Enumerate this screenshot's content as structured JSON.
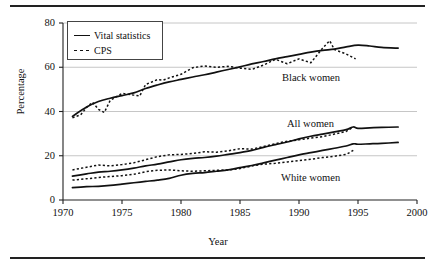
{
  "chart_data": {
    "type": "line",
    "title": "",
    "xlabel": "Year",
    "ylabel": "Percentage",
    "xlim": [
      1970,
      2000
    ],
    "ylim": [
      0,
      80
    ],
    "xticks": [
      1970,
      1975,
      1980,
      1985,
      1990,
      1995,
      2000
    ],
    "yticks": [
      0,
      20,
      40,
      60,
      80
    ],
    "grid": "horizontal",
    "legend_position": "top-left",
    "legend": [
      {
        "label": "Vital statistics",
        "style": "solid"
      },
      {
        "label": "CPS",
        "style": "dashed"
      }
    ],
    "annotations": [
      {
        "text": "Black women"
      },
      {
        "text": "All women"
      },
      {
        "text": "White women"
      }
    ],
    "series": [
      {
        "name": "Black women - Vital statistics",
        "group": "Black women",
        "source": "Vital statistics",
        "style": "solid",
        "x": [
          1970.8,
          1972,
          1973,
          1974,
          1975,
          1976,
          1977,
          1978,
          1979,
          1980,
          1981,
          1982,
          1983,
          1984,
          1985,
          1986,
          1987,
          1988,
          1989,
          1990,
          1991,
          1992,
          1993,
          1994,
          1995,
          1996,
          1997,
          1998.4
        ],
        "y": [
          37.8,
          42.0,
          44.5,
          46.0,
          47.2,
          48.4,
          50.4,
          52.0,
          53.4,
          54.5,
          55.6,
          56.6,
          57.8,
          59.0,
          60.2,
          61.5,
          62.6,
          63.8,
          64.8,
          65.8,
          66.8,
          67.6,
          68.2,
          69.2,
          70.0,
          69.6,
          69.0,
          68.6
        ]
      },
      {
        "name": "Black women - CPS",
        "group": "Black women",
        "source": "CPS",
        "style": "dashed",
        "x": [
          1970.8,
          1971.5,
          1972,
          1972.5,
          1973,
          1973.5,
          1974,
          1975,
          1976,
          1976.5,
          1977,
          1978,
          1978.5,
          1979,
          1980,
          1981,
          1982,
          1983,
          1984,
          1985,
          1986,
          1987,
          1988,
          1989,
          1990,
          1991,
          1992,
          1992.6,
          1993,
          1994,
          1994.8
        ],
        "y": [
          37.2,
          38.5,
          41.8,
          44.2,
          41.0,
          39.6,
          45.0,
          48.2,
          47.4,
          47.0,
          52.2,
          54.4,
          54.2,
          55.2,
          56.8,
          59.8,
          60.6,
          60.0,
          60.4,
          59.6,
          59.0,
          61.0,
          63.6,
          61.6,
          63.8,
          62.0,
          68.6,
          72.0,
          68.0,
          66.0,
          63.8
        ]
      },
      {
        "name": "All women - Vital statistics",
        "group": "All women",
        "source": "Vital statistics",
        "style": "solid",
        "x": [
          1970.8,
          1972,
          1973,
          1974,
          1975,
          1976,
          1977,
          1978,
          1979,
          1980,
          1981,
          1982,
          1983,
          1984,
          1985,
          1986,
          1987,
          1988,
          1989,
          1990,
          1991,
          1992,
          1993,
          1994,
          1994.6,
          1995,
          1996,
          1997,
          1998.4
        ],
        "y": [
          10.8,
          11.8,
          12.6,
          13.0,
          13.6,
          14.4,
          15.4,
          16.2,
          17.2,
          18.2,
          18.8,
          19.2,
          19.8,
          20.6,
          21.4,
          22.4,
          23.8,
          25.0,
          26.2,
          27.6,
          28.8,
          29.8,
          30.8,
          31.8,
          33.0,
          32.4,
          32.6,
          32.8,
          33.0
        ]
      },
      {
        "name": "All women - CPS",
        "group": "All women",
        "source": "CPS",
        "style": "dashed",
        "x": [
          1970.8,
          1972,
          1973,
          1974,
          1975,
          1976,
          1977,
          1978,
          1979,
          1980,
          1981,
          1982,
          1983,
          1984,
          1985,
          1986,
          1987,
          1988,
          1989,
          1990,
          1991,
          1992,
          1993,
          1994,
          1994.6
        ],
        "y": [
          13.6,
          14.8,
          15.8,
          15.4,
          16.0,
          16.8,
          18.2,
          19.6,
          20.4,
          20.6,
          21.0,
          21.8,
          21.6,
          22.2,
          23.2,
          23.0,
          24.2,
          25.4,
          26.6,
          27.2,
          28.0,
          28.6,
          29.8,
          31.0,
          33.0
        ]
      },
      {
        "name": "White women - Vital statistics",
        "group": "White women",
        "source": "Vital statistics",
        "style": "solid",
        "x": [
          1970.8,
          1972,
          1973,
          1974,
          1975,
          1976,
          1977,
          1978,
          1979,
          1980,
          1981,
          1982,
          1983,
          1984,
          1985,
          1986,
          1987,
          1988,
          1989,
          1990,
          1991,
          1992,
          1993,
          1994,
          1994.6,
          1995,
          1996,
          1997,
          1998.4
        ],
        "y": [
          5.6,
          6.0,
          6.2,
          6.6,
          7.2,
          7.8,
          8.4,
          9.0,
          9.8,
          11.2,
          12.0,
          12.4,
          13.0,
          13.6,
          14.6,
          15.6,
          16.8,
          18.0,
          19.2,
          20.4,
          21.4,
          22.4,
          23.4,
          24.4,
          25.4,
          25.2,
          25.4,
          25.6,
          26.0
        ]
      },
      {
        "name": "White women - CPS",
        "group": "White women",
        "source": "CPS",
        "style": "dashed",
        "x": [
          1970.8,
          1972,
          1973,
          1974,
          1975,
          1976,
          1977,
          1978,
          1979,
          1980,
          1981,
          1982,
          1983,
          1984,
          1985,
          1986,
          1987,
          1988,
          1989,
          1990,
          1991,
          1992,
          1993,
          1994,
          1994.6
        ],
        "y": [
          9.0,
          9.6,
          10.2,
          10.6,
          11.0,
          11.6,
          12.8,
          13.4,
          13.6,
          13.2,
          13.0,
          13.2,
          13.4,
          13.6,
          14.2,
          15.4,
          16.2,
          16.6,
          17.2,
          17.8,
          18.4,
          19.2,
          19.8,
          20.6,
          22.4
        ]
      }
    ]
  }
}
